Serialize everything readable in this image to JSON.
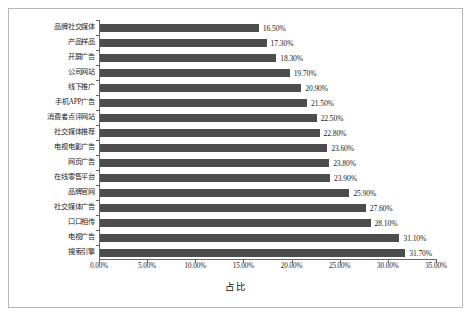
{
  "chart_data": {
    "type": "bar",
    "orientation": "horizontal",
    "title": "",
    "xlabel": "占比",
    "ylabel": "",
    "xlim": [
      0,
      35
    ],
    "xtick_labels": [
      "0.00%",
      "5.00%",
      "10.00%",
      "15.00%",
      "20.00%",
      "25.00%",
      "30.00%",
      "35.00%"
    ],
    "xtick_values": [
      0,
      5,
      10,
      15,
      20,
      25,
      30,
      35
    ],
    "grid": false,
    "legend": null,
    "bar_color": "#4d4d4d",
    "categories": [
      "品牌社交媒体",
      "产品样品",
      "开屏广告",
      "公司网站",
      "线下推广",
      "手机APP广告",
      "消费者点评网站",
      "社交媒体推荐",
      "电视电影广告",
      "网页广告",
      "在线零售平台",
      "品牌官网",
      "社交媒体广告",
      "口口相传",
      "电视广告",
      "搜索引擎"
    ],
    "values": [
      16.5,
      17.3,
      18.3,
      19.7,
      20.9,
      21.5,
      22.5,
      22.8,
      23.6,
      23.8,
      23.9,
      25.9,
      27.6,
      28.1,
      31.1,
      31.7
    ],
    "value_labels": [
      "16.50%",
      "17.30%",
      "18.30%",
      "19.70%",
      "20.90%",
      "21.50%",
      "22.50%",
      "22.80%",
      "23.60%",
      "23.80%",
      "23.90%",
      "25.90%",
      "27.60%",
      "28.10%",
      "31.10%",
      "31.70%"
    ]
  }
}
